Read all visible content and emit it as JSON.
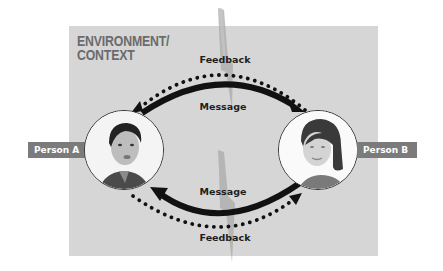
{
  "environment": {
    "title": "ENVIRONMENT/\nCONTEXT",
    "background_color": "#d6d6d6"
  },
  "participants": [
    {
      "id": "a",
      "label": "Person A",
      "depiction": "man-portrait"
    },
    {
      "id": "b",
      "label": "Person B",
      "depiction": "woman-portrait"
    }
  ],
  "flows": {
    "top_feedback": {
      "label": "Feedback",
      "style": "dotted",
      "direction": "B-to-A"
    },
    "top_message": {
      "label": "Message",
      "style": "solid",
      "direction": "A-to-B"
    },
    "bottom_message": {
      "label": "Message",
      "style": "solid",
      "direction": "B-to-A"
    },
    "bottom_feedback": {
      "label": "Feedback",
      "style": "dotted",
      "direction": "A-to-B"
    }
  },
  "colors": {
    "arrow": "#111111",
    "tag_bg": "#7b7b7b",
    "tag_text": "#ffffff",
    "title_text": "#6b6b6b",
    "noise_bolt": "#a8a8a8"
  }
}
